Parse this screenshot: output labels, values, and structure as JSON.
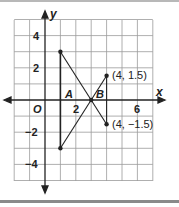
{
  "diagram": {
    "type": "coordinate-plane",
    "axes": {
      "x_label": "x",
      "y_label": "y",
      "origin_label": "O"
    },
    "x_ticks": [
      {
        "value": 2,
        "label": "2"
      },
      {
        "value": 6,
        "label": "6"
      }
    ],
    "y_ticks": [
      {
        "value": 4,
        "label": "4"
      },
      {
        "value": 2,
        "label": "2"
      },
      {
        "value": -2,
        "label": "−2"
      },
      {
        "value": -4,
        "label": "−4"
      }
    ],
    "grid": {
      "x_range": [
        -2,
        7
      ],
      "y_range": [
        -5,
        5
      ]
    },
    "segments": [
      {
        "from": [
          1,
          3
        ],
        "to": [
          1,
          -3
        ]
      },
      {
        "from": [
          1,
          3
        ],
        "to": [
          4,
          -1.5
        ]
      },
      {
        "from": [
          1,
          -3
        ],
        "to": [
          4,
          1.5
        ]
      },
      {
        "from": [
          4,
          1.5
        ],
        "to": [
          4,
          -1.5
        ]
      }
    ],
    "points": [
      {
        "coord": [
          1,
          3
        ]
      },
      {
        "coord": [
          1,
          -3
        ]
      },
      {
        "coord": [
          3,
          0
        ]
      },
      {
        "coord": [
          4,
          1.5
        ],
        "label": "(4, 1.5)"
      },
      {
        "coord": [
          4,
          -1.5
        ],
        "label": "(4, −1.5)"
      }
    ],
    "region_labels": {
      "a": "A",
      "b": "B"
    }
  }
}
